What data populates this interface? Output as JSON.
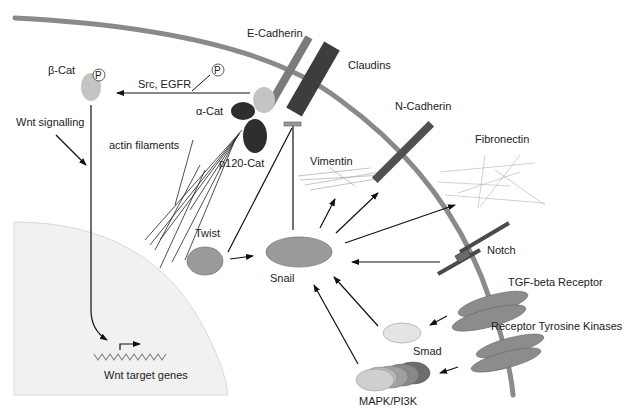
{
  "colors": {
    "membrane": "#8a8a8a",
    "nucleus": "#f1f1f1",
    "nucleus_edge": "#d6d6d6",
    "e_cadherin": "#7b7b7b",
    "claudins": "#3d3d3d",
    "catenin_dark": "#2e2e2e",
    "beta_cat": "#c4c4c4",
    "snail": "#9a9a9a",
    "twist": "#9a9a9a",
    "smad": "#e4e4e4",
    "n_cadherin": "#505050",
    "notch": "#4a4a4a",
    "receptor": "#8c8c8c",
    "filament": "#bdbdbd",
    "arrow": "#111111"
  },
  "labels": {
    "e_cadherin": "E-Cadherin",
    "claudins": "Claudins",
    "beta_cat": "β-Cat",
    "phospho_1": "P",
    "phospho_2": "P",
    "src_egfr": "Src, EGFR",
    "alpha_cat": "α-Cat",
    "p120_cat": "p120-Cat",
    "wnt_signalling": "Wnt signalling",
    "actin_filaments": "actin filaments",
    "n_cadherin": "N-Cadherin",
    "fibronectin": "Fibronectin",
    "vimentin": "Vimentin",
    "twist": "Twist",
    "snail": "Snail",
    "notch": "Notch",
    "tgf_beta_receptor": "TGF-beta Receptor",
    "receptor_tyrosine_kinases": "Receptor Tyrosine Kinases",
    "smad": "Smad",
    "mapk_pi3k": "MAPK/PI3K",
    "wnt_target_genes": "Wnt target genes"
  }
}
